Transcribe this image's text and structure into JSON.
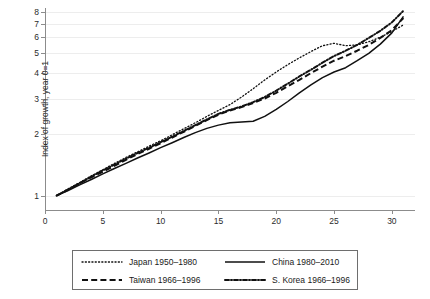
{
  "chart_data": {
    "type": "line",
    "title": "",
    "xlabel": "",
    "ylabel": "Index of growth, year 0=1",
    "xlim": [
      0,
      32
    ],
    "ylim": [
      0.85,
      8.35
    ],
    "xticks": [
      0,
      5,
      10,
      15,
      20,
      25,
      30
    ],
    "yticks": [
      1,
      2,
      3,
      4,
      5,
      6,
      7,
      8
    ],
    "grid": true,
    "legend_position": "below-plot",
    "series": [
      {
        "name": "Japan 1950–1980",
        "style": "dotted",
        "x": [
          1,
          2,
          3,
          4,
          5,
          6,
          7,
          8,
          9,
          10,
          11,
          12,
          13,
          14,
          15,
          16,
          17,
          18,
          19,
          20,
          21,
          22,
          23,
          24,
          25,
          26,
          27,
          28,
          29,
          30,
          31
        ],
        "values": [
          1.0,
          1.08,
          1.16,
          1.25,
          1.34,
          1.44,
          1.54,
          1.64,
          1.75,
          1.86,
          1.99,
          2.13,
          2.28,
          2.45,
          2.62,
          2.8,
          3.05,
          3.35,
          3.7,
          4.05,
          4.4,
          4.75,
          5.1,
          5.45,
          5.6,
          5.45,
          5.5,
          5.7,
          6.0,
          6.4,
          6.9
        ]
      },
      {
        "name": "China 1980–2010",
        "style": "solid",
        "x": [
          1,
          2,
          3,
          4,
          5,
          6,
          7,
          8,
          9,
          10,
          11,
          12,
          13,
          14,
          15,
          16,
          17,
          18,
          19,
          20,
          21,
          22,
          23,
          24,
          25,
          26,
          27,
          28,
          29,
          30,
          31
        ],
        "values": [
          1.0,
          1.06,
          1.13,
          1.2,
          1.28,
          1.36,
          1.44,
          1.53,
          1.62,
          1.72,
          1.82,
          1.93,
          2.04,
          2.14,
          2.22,
          2.28,
          2.3,
          2.32,
          2.45,
          2.65,
          2.9,
          3.2,
          3.5,
          3.8,
          4.05,
          4.25,
          4.6,
          5.0,
          5.55,
          6.3,
          7.6
        ]
      },
      {
        "name": "Taiwan 1966–1996",
        "style": "dashed",
        "x": [
          1,
          2,
          3,
          4,
          5,
          6,
          7,
          8,
          9,
          10,
          11,
          12,
          13,
          14,
          15,
          16,
          17,
          18,
          19,
          20,
          21,
          22,
          23,
          24,
          25,
          26,
          27,
          28,
          29,
          30,
          31
        ],
        "values": [
          1.0,
          1.07,
          1.15,
          1.23,
          1.31,
          1.4,
          1.5,
          1.6,
          1.7,
          1.81,
          1.93,
          2.06,
          2.2,
          2.35,
          2.5,
          2.62,
          2.72,
          2.85,
          3.0,
          3.2,
          3.45,
          3.7,
          4.0,
          4.3,
          4.6,
          4.85,
          5.15,
          5.5,
          5.95,
          6.5,
          7.45
        ]
      },
      {
        "name": "S. Korea 1966–1996",
        "style": "dash-dot",
        "x": [
          1,
          2,
          3,
          4,
          5,
          6,
          7,
          8,
          9,
          10,
          11,
          12,
          13,
          14,
          15,
          16,
          17,
          18,
          19,
          20,
          21,
          22,
          23,
          24,
          25,
          26,
          27,
          28,
          29,
          30,
          31
        ],
        "values": [
          1.0,
          1.07,
          1.15,
          1.24,
          1.33,
          1.42,
          1.52,
          1.62,
          1.72,
          1.83,
          1.95,
          2.08,
          2.22,
          2.37,
          2.52,
          2.64,
          2.74,
          2.88,
          3.05,
          3.28,
          3.55,
          3.85,
          4.15,
          4.5,
          4.85,
          5.15,
          5.5,
          5.95,
          6.45,
          7.1,
          8.1
        ]
      }
    ]
  },
  "legend": {
    "items": [
      {
        "label": "Japan 1950–1980",
        "style": "dotted"
      },
      {
        "label": "China 1980–2010",
        "style": "solid"
      },
      {
        "label": "Taiwan 1966–1996",
        "style": "dashed"
      },
      {
        "label": "S. Korea 1966–1996",
        "style": "dash-dot"
      }
    ]
  },
  "colors": {
    "line": "#111111",
    "axis": "#8c8c8c",
    "grid": "#ededed",
    "text": "#1a1a1a",
    "background": "#ffffff"
  }
}
